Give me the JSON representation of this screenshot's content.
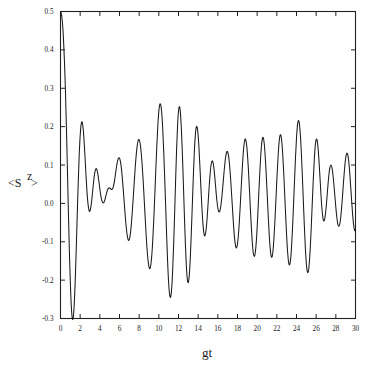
{
  "figure": {
    "name": "atomic-inversion-plot",
    "background_color": "#ffffff",
    "curve_color": "#1a1a1a",
    "axis_color": "#222222"
  },
  "axes": {
    "x_label": "gt",
    "y_label_prefix": "<S",
    "y_label_superscript": "z",
    "y_label_suffix": ">",
    "x_tick_labels": [
      "0",
      "2",
      "4",
      "6",
      "8",
      "10",
      "12",
      "14",
      "16",
      "18",
      "20",
      "22",
      "24",
      "26",
      "28",
      "30"
    ],
    "y_tick_labels": [
      "0.5",
      "0.4",
      "0.3",
      "0.2",
      "0.1",
      "0.0",
      "-0.1",
      "-0.2",
      "-0.3"
    ]
  },
  "chart_data": {
    "type": "line",
    "title": "",
    "subtitle": "",
    "xlabel": "gt",
    "ylabel": "<S^z>",
    "xlim": [
      0,
      30
    ],
    "ylim": [
      -0.3,
      0.5
    ],
    "xticks": [
      0,
      2,
      4,
      6,
      8,
      10,
      12,
      14,
      16,
      18,
      20,
      22,
      24,
      26,
      28,
      30
    ],
    "yticks": [
      0.5,
      0.4,
      0.3,
      0.2,
      0.1,
      0.0,
      -0.1,
      -0.2,
      -0.3
    ],
    "x_minor_ticks_every": 2,
    "grid": false,
    "legend": null,
    "legend_position": "none",
    "annotations": [],
    "series": [
      {
        "name": "<S^z>",
        "color": "#1a1a1a",
        "x": [
          0.0,
          0.1,
          0.2,
          0.3,
          0.4,
          0.5,
          0.6,
          0.7,
          0.8,
          0.9,
          1.0,
          1.1,
          1.2,
          1.3,
          1.4,
          1.5,
          1.6,
          1.7,
          1.8,
          1.9,
          2.0,
          2.1,
          2.2,
          2.3,
          2.4,
          2.5,
          2.6,
          2.7,
          2.8,
          2.9,
          3.0,
          3.1,
          3.2,
          3.3,
          3.4,
          3.5,
          3.6,
          3.7,
          3.8,
          3.9,
          4.0,
          4.1,
          4.2,
          4.3,
          4.4,
          4.5,
          4.6,
          4.7,
          4.8,
          4.9,
          5.0,
          5.1,
          5.2,
          5.3,
          5.4,
          5.5,
          5.6,
          5.7,
          5.8,
          5.9,
          6.0,
          6.1,
          6.2,
          6.3,
          6.4,
          6.5,
          6.6,
          6.7,
          6.8,
          6.9,
          7.0,
          7.1,
          7.2,
          7.3,
          7.4,
          7.5,
          7.6,
          7.7,
          7.8,
          7.9,
          8.0,
          8.1,
          8.2,
          8.3,
          8.4,
          8.5,
          8.6,
          8.7,
          8.8,
          8.9,
          9.0,
          9.1,
          9.2,
          9.3,
          9.4,
          9.5,
          9.6,
          9.7,
          9.8,
          9.9,
          10.0,
          10.1,
          10.2,
          10.3,
          10.4,
          10.5,
          10.6,
          10.7,
          10.8,
          10.9,
          11.0,
          11.1,
          11.2,
          11.3,
          11.4,
          11.5,
          11.6,
          11.7,
          11.8,
          11.9,
          12.0,
          12.1,
          12.2,
          12.3,
          12.4,
          12.5,
          12.6,
          12.7,
          12.8,
          12.9,
          13.0,
          13.1,
          13.2,
          13.3,
          13.4,
          13.5,
          13.6,
          13.7,
          13.8,
          13.9,
          14.0,
          14.1,
          14.2,
          14.3,
          14.4,
          14.5,
          14.6,
          14.7,
          14.8,
          14.9,
          15.0,
          15.1,
          15.2,
          15.3,
          15.4,
          15.5,
          15.6,
          15.7,
          15.8,
          15.9,
          16.0,
          16.1,
          16.2,
          16.3,
          16.4,
          16.5,
          16.6,
          16.7,
          16.8,
          16.9,
          17.0,
          17.1,
          17.2,
          17.3,
          17.4,
          17.5,
          17.6,
          17.7,
          17.8,
          17.9,
          18.0,
          18.1,
          18.2,
          18.3,
          18.4,
          18.5,
          18.6,
          18.7,
          18.8,
          18.9,
          19.0,
          19.1,
          19.2,
          19.3,
          19.4,
          19.5,
          19.6,
          19.7,
          19.8,
          19.9,
          20.0,
          20.1,
          20.2,
          20.3,
          20.4,
          20.5,
          20.6,
          20.7,
          20.8,
          20.9,
          21.0,
          21.1,
          21.2,
          21.3,
          21.4,
          21.5,
          21.6,
          21.7,
          21.8,
          21.9,
          22.0,
          22.1,
          22.2,
          22.3,
          22.4,
          22.5,
          22.6,
          22.7,
          22.8,
          22.9,
          23.0,
          23.1,
          23.2,
          23.3,
          23.4,
          23.5,
          23.6,
          23.7,
          23.8,
          23.9,
          24.0,
          24.1,
          24.2,
          24.3,
          24.4,
          24.5,
          24.6,
          24.7,
          24.8,
          24.9,
          25.0,
          25.1,
          25.2,
          25.3,
          25.4,
          25.5,
          25.6,
          25.7,
          25.8,
          25.9,
          26.0,
          26.1,
          26.2,
          26.3,
          26.4,
          26.5,
          26.6,
          26.7,
          26.8,
          26.9,
          27.0,
          27.1,
          27.2,
          27.3,
          27.4,
          27.5,
          27.6,
          27.7,
          27.8,
          27.9,
          28.0,
          28.1,
          28.2,
          28.3,
          28.4,
          28.5,
          28.6,
          28.7,
          28.8,
          28.9,
          29.0,
          29.1,
          29.2,
          29.3,
          29.4,
          29.5,
          29.6,
          29.7,
          29.8,
          29.9,
          30.0
        ],
        "y": [
          0.5,
          0.492,
          0.47,
          0.43,
          0.372,
          0.296,
          0.2,
          0.092,
          -0.02,
          -0.122,
          -0.206,
          -0.268,
          -0.3,
          -0.296,
          -0.262,
          -0.2,
          -0.12,
          -0.032,
          0.052,
          0.124,
          0.176,
          0.206,
          0.212,
          0.196,
          0.162,
          0.118,
          0.07,
          0.028,
          -0.002,
          -0.018,
          -0.02,
          -0.008,
          0.014,
          0.04,
          0.064,
          0.082,
          0.09,
          0.088,
          0.076,
          0.058,
          0.038,
          0.02,
          0.008,
          0.002,
          0.002,
          0.008,
          0.018,
          0.028,
          0.036,
          0.04,
          0.04,
          0.038,
          0.036,
          0.038,
          0.046,
          0.06,
          0.078,
          0.096,
          0.11,
          0.118,
          0.118,
          0.108,
          0.09,
          0.062,
          0.03,
          -0.004,
          -0.038,
          -0.066,
          -0.086,
          -0.096,
          -0.094,
          -0.08,
          -0.056,
          -0.022,
          0.016,
          0.056,
          0.094,
          0.126,
          0.15,
          0.164,
          0.166,
          0.156,
          0.134,
          0.102,
          0.062,
          0.016,
          -0.032,
          -0.078,
          -0.118,
          -0.148,
          -0.166,
          -0.17,
          -0.158,
          -0.13,
          -0.088,
          -0.034,
          0.028,
          0.092,
          0.152,
          0.204,
          0.24,
          0.258,
          0.256,
          0.234,
          0.192,
          0.134,
          0.064,
          -0.012,
          -0.088,
          -0.156,
          -0.208,
          -0.238,
          -0.244,
          -0.224,
          -0.178,
          -0.112,
          -0.032,
          0.054,
          0.136,
          0.2,
          0.24,
          0.252,
          0.234,
          0.19,
          0.126,
          0.048,
          -0.032,
          -0.106,
          -0.164,
          -0.198,
          -0.206,
          -0.186,
          -0.142,
          -0.08,
          -0.008,
          0.064,
          0.128,
          0.174,
          0.198,
          0.198,
          0.176,
          0.136,
          0.084,
          0.03,
          -0.02,
          -0.058,
          -0.08,
          -0.084,
          -0.07,
          -0.042,
          -0.004,
          0.036,
          0.072,
          0.098,
          0.11,
          0.108,
          0.092,
          0.066,
          0.036,
          0.008,
          -0.012,
          -0.022,
          -0.02,
          -0.008,
          0.014,
          0.042,
          0.072,
          0.1,
          0.122,
          0.134,
          0.134,
          0.122,
          0.098,
          0.064,
          0.024,
          -0.018,
          -0.058,
          -0.09,
          -0.11,
          -0.116,
          -0.106,
          -0.08,
          -0.042,
          0.004,
          0.052,
          0.098,
          0.136,
          0.16,
          0.168,
          0.158,
          0.132,
          0.092,
          0.044,
          -0.008,
          -0.058,
          -0.1,
          -0.128,
          -0.138,
          -0.13,
          -0.104,
          -0.062,
          -0.01,
          0.044,
          0.096,
          0.138,
          0.164,
          0.172,
          0.16,
          0.13,
          0.086,
          0.034,
          -0.02,
          -0.07,
          -0.11,
          -0.134,
          -0.14,
          -0.126,
          -0.094,
          -0.048,
          0.006,
          0.06,
          0.11,
          0.15,
          0.174,
          0.178,
          0.162,
          0.128,
          0.08,
          0.024,
          -0.034,
          -0.086,
          -0.128,
          -0.154,
          -0.16,
          -0.146,
          -0.112,
          -0.062,
          -0.002,
          0.06,
          0.12,
          0.17,
          0.204,
          0.216,
          0.206,
          0.176,
          0.128,
          0.068,
          0.004,
          -0.06,
          -0.116,
          -0.156,
          -0.178,
          -0.178,
          -0.156,
          -0.116,
          -0.062,
          -0.002,
          0.058,
          0.11,
          0.148,
          0.166,
          0.164,
          0.142,
          0.106,
          0.062,
          0.018,
          -0.018,
          -0.04,
          -0.046,
          -0.036,
          -0.014,
          0.016,
          0.048,
          0.076,
          0.094,
          0.1,
          0.094,
          0.076,
          0.05,
          0.02,
          -0.01,
          -0.036,
          -0.054,
          -0.06,
          -0.054,
          -0.036,
          -0.008,
          0.026,
          0.062,
          0.094,
          0.118,
          0.13,
          0.128,
          0.112,
          0.084,
          0.048,
          0.01,
          -0.026,
          -0.054,
          -0.07,
          -0.072
        ]
      }
    ]
  }
}
